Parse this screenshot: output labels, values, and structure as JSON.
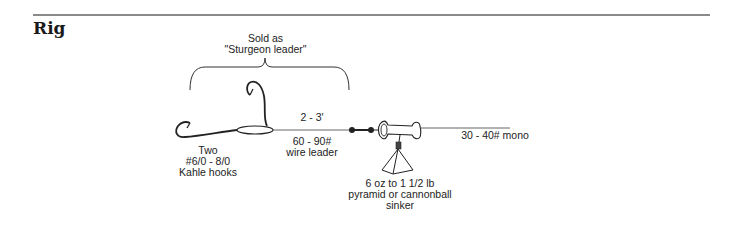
{
  "section": {
    "title": "Rig"
  },
  "diagram": {
    "bracket_label_line1": "Sold as",
    "bracket_label_line2": "\"Sturgeon leader\"",
    "hook_label_line1": "Two",
    "hook_label_line2": "#6/0 - 8/0",
    "hook_label_line3": "Kahle hooks",
    "leader_length": "2 - 3'",
    "leader_strength_line1": "60 - 90#",
    "leader_strength_line2": "wire leader",
    "mainline_label": "30 - 40# mono",
    "sinker_label_line1": "6 oz to 1 1/2 lb",
    "sinker_label_line2": "pyramid or cannonball",
    "sinker_label_line3": "sinker"
  },
  "colors": {
    "ink": "#222222",
    "rule": "#8a8a8a"
  }
}
